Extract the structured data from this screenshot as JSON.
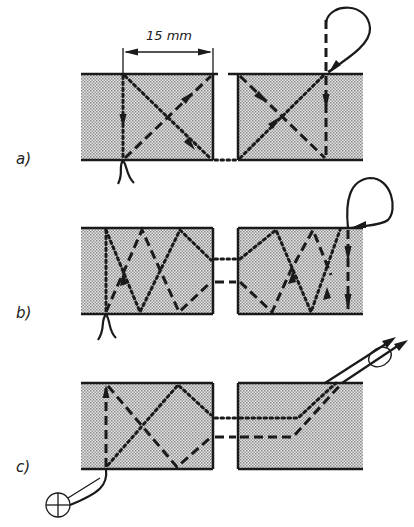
{
  "diagram": {
    "dimension_label": "15 mm",
    "panels": [
      {
        "id": "a",
        "label": "a)"
      },
      {
        "id": "b",
        "label": "b)"
      },
      {
        "id": "c",
        "label": "c)"
      }
    ],
    "legend": {
      "dashed_line": "thread path (dashed)",
      "dotted_line": "thread path (dotted)"
    },
    "colors": {
      "fabric_fill": "#bdbdbd",
      "ink": "#1a1a1a",
      "background": "#ffffff"
    }
  }
}
